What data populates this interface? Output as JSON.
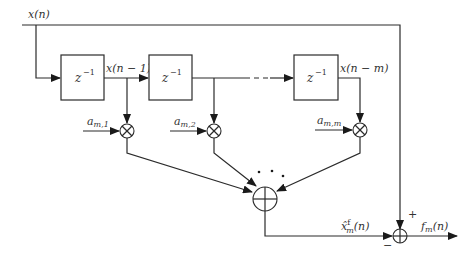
{
  "diagram": {
    "title": "",
    "input_signal": "x(n)",
    "delay_blocks": [
      {
        "label": "z",
        "exponent": "−1",
        "output_label": "x(n − 1)"
      },
      {
        "label": "z",
        "exponent": "−1",
        "output_label": ""
      },
      {
        "label": "z",
        "exponent": "−1",
        "output_label": "x(n − m)"
      }
    ],
    "coefficients": [
      {
        "base": "a",
        "sub": "m,1"
      },
      {
        "base": "a",
        "sub": "m,2"
      },
      {
        "base": "a",
        "sub": "m,m"
      }
    ],
    "multiplier_symbol": "⊗",
    "summation_symbol": "⊕",
    "ellipsis": "• • •",
    "prediction": {
      "base": "x̂",
      "sup": "f",
      "sub": "m",
      "arg": "(n)"
    },
    "output": {
      "base": "f",
      "sub": "m",
      "arg": "(n)"
    },
    "plus_sign": "+",
    "minus_sign": "−"
  }
}
